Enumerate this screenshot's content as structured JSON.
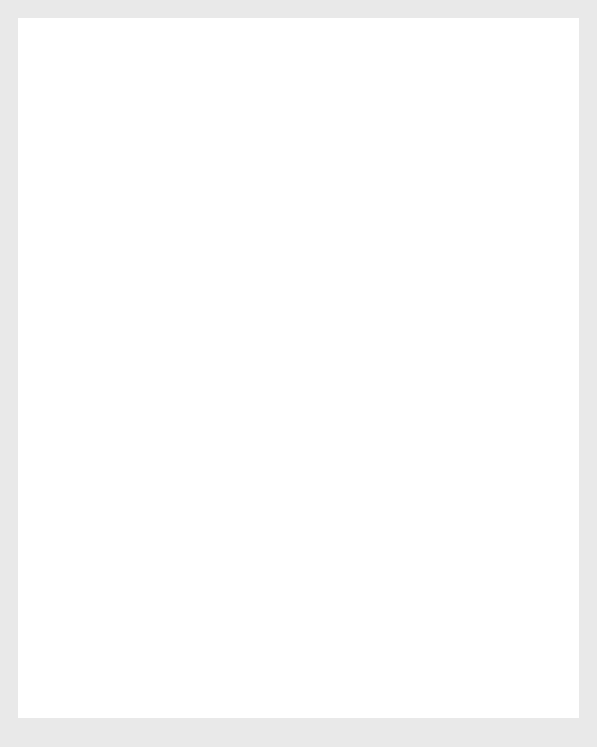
{
  "figure": {
    "background_color": "#e9e9e9",
    "card_color": "#ffffff",
    "plot_background_color": "#a9a9a9",
    "gridline_color": "#ffffff",
    "line_color": "#4a4a4a"
  },
  "chart_data": {
    "type": "line",
    "title": "",
    "subtitle": "",
    "xlabel": "Wavelength/nm",
    "ylabel": "Relative efficiency in causing sunburn of pale skin/%",
    "xlim": [
      210,
      400
    ],
    "ylim": [
      0,
      100
    ],
    "xticks": [
      220,
      240,
      260,
      280,
      300,
      320,
      340,
      360,
      380,
      400
    ],
    "xtick_labels": [
      "220",
      "240",
      "260",
      "280",
      "300",
      "320",
      "340",
      "360",
      "380",
      "400"
    ],
    "yticks": [
      0,
      10,
      20,
      30,
      40,
      50,
      60,
      70,
      80,
      90,
      100
    ],
    "ytick_labels": [
      "0",
      "10",
      "20",
      "30",
      "40",
      "50",
      "60",
      "70",
      "80",
      "90",
      "100"
    ],
    "grid": true,
    "legend": "none",
    "series": [
      {
        "name": "Erythemal action spectrum",
        "x": [
          215,
          225,
          240,
          250,
          263,
          280,
          285,
          295,
          297,
          298,
          310,
          320
        ],
        "y": [
          51,
          70,
          90,
          100,
          85,
          65.5,
          60.5,
          60.5,
          70,
          82,
          19,
          0
        ]
      }
    ],
    "annotations": [
      {
        "label": "UVC",
        "x_start": 210,
        "x_end": 280
      },
      {
        "label": "UVB",
        "x_start": 282,
        "x_end": 302
      },
      {
        "label": "UVA",
        "x_start": 304,
        "x_end": 400
      }
    ]
  },
  "bands": {
    "uvc": "UVC",
    "uvb": "UVB",
    "uva": "UVA"
  },
  "axes": {
    "x_title": "Wavelength/nm",
    "y_title": "Relative efficiency in causing sunburn of pale skin/%"
  },
  "xticks": {
    "t0": "220",
    "t1": "240",
    "t2": "260",
    "t3": "280",
    "t4": "300",
    "t5": "320",
    "t6": "340",
    "t7": "360",
    "t8": "380",
    "t9": "400"
  },
  "yticks": {
    "t0": "0",
    "t1": "10",
    "t2": "20",
    "t3": "30",
    "t4": "40",
    "t5": "50",
    "t6": "60",
    "t7": "70",
    "t8": "80",
    "t9": "90",
    "t10": "100"
  }
}
